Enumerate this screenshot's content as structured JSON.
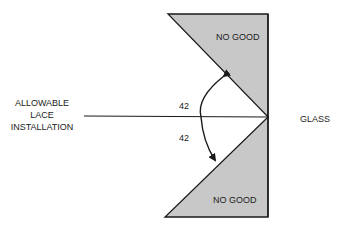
{
  "diagram": {
    "labels": {
      "left_line1": "ALLOWABLE",
      "left_line2": "LACE",
      "left_line3": "INSTALLATION",
      "right": "GLASS",
      "top_region": "NO GOOD",
      "bottom_region": "NO GOOD",
      "angle_upper": "42",
      "angle_lower": "42"
    },
    "colors": {
      "region_fill": "#c8c8c8",
      "stroke": "#1a1a1a",
      "background": "#ffffff"
    }
  }
}
